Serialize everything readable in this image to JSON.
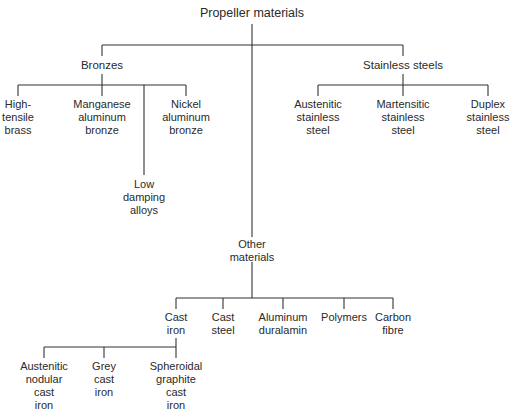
{
  "title": "Propeller materials",
  "groups": {
    "bronzes": {
      "label": "Bronzes",
      "children": [
        "High-\ntensile\nbrass",
        "Manganese\naluminum\nbronze",
        "Low\ndamping\nalloys",
        "Nickel\naluminum\nbronze"
      ]
    },
    "stainless": {
      "label": "Stainless steels",
      "children": [
        "Austenitic\nstainless\nsteel",
        "Martensitic\nstainless\nsteel",
        "Duplex\nstainless\nsteel"
      ]
    },
    "other": {
      "label": "Other\nmaterials",
      "children": [
        "Cast\niron",
        "Cast\nsteel",
        "Aluminum\nduralamin",
        "Polymers",
        "Carbon\nfibre"
      ]
    },
    "cast_iron": {
      "children": [
        "Austenitic\nnodular\ncast\niron",
        "Grey\ncast\niron",
        "Spheroidal\ngraphite\ncast\niron"
      ]
    }
  },
  "colors": {
    "line": "#333333",
    "text": "#2a2a2a",
    "background": "#ffffff"
  }
}
